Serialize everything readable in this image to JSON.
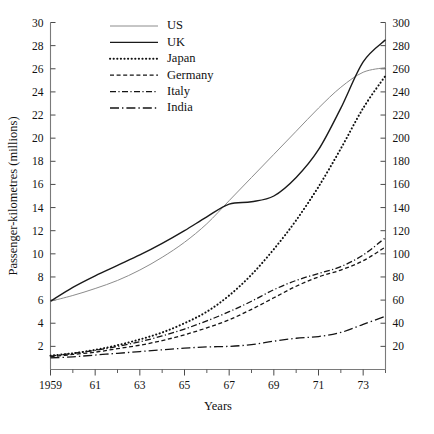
{
  "chart_data": {
    "type": "line",
    "title": "",
    "xlabel": "Years",
    "ylabel": "Passenger-kilometres (millions)",
    "xlim": [
      1959,
      1974
    ],
    "ylim": [
      0,
      30
    ],
    "y2lim": [
      0,
      300
    ],
    "grid": false,
    "legend_position": "top-left-inside",
    "x_tick_labels": [
      "1959",
      "61",
      "63",
      "65",
      "67",
      "69",
      "71",
      "73"
    ],
    "x_tick_values": [
      1959,
      1961,
      1963,
      1965,
      1967,
      1969,
      1971,
      1973
    ],
    "x_minor_values": [
      1960,
      1962,
      1964,
      1966,
      1968,
      1970,
      1972,
      1974
    ],
    "y_tick_labels": [
      "2",
      "4",
      "6",
      "8",
      "10",
      "12",
      "14",
      "16",
      "18",
      "20",
      "22",
      "24",
      "26",
      "28",
      "30"
    ],
    "y_tick_values": [
      2,
      4,
      6,
      8,
      10,
      12,
      14,
      16,
      18,
      20,
      22,
      24,
      26,
      28,
      30
    ],
    "y2_tick_labels": [
      "20",
      "40",
      "60",
      "80",
      "100",
      "120",
      "140",
      "160",
      "180",
      "200",
      "220",
      "240",
      "260",
      "280",
      "300"
    ],
    "y2_tick_values": [
      20,
      40,
      60,
      80,
      100,
      120,
      140,
      160,
      180,
      200,
      220,
      240,
      260,
      280,
      300
    ],
    "x": [
      1959,
      1960,
      1961,
      1962,
      1963,
      1964,
      1965,
      1966,
      1967,
      1968,
      1969,
      1970,
      1971,
      1972,
      1973,
      1974
    ],
    "series": [
      {
        "name": "US",
        "style": "solid-thin-gray",
        "color": "#8c8c8c",
        "width": 1.0,
        "dash": "none",
        "values": [
          5.9,
          6.4,
          7.0,
          7.7,
          8.6,
          9.7,
          11.0,
          12.6,
          14.6,
          16.6,
          18.6,
          20.6,
          22.6,
          24.4,
          25.7,
          26.1
        ]
      },
      {
        "name": "UK",
        "style": "solid-black",
        "color": "#1a1a1a",
        "width": 1.4,
        "dash": "none",
        "values": [
          5.9,
          7.1,
          8.1,
          9.0,
          9.9,
          10.9,
          12.0,
          13.2,
          14.3,
          14.5,
          15.0,
          16.6,
          19.0,
          22.6,
          26.6,
          28.5
        ]
      },
      {
        "name": "Japan",
        "style": "dotted",
        "color": "#111111",
        "width": 2.0,
        "dash": "0.2,3.4",
        "values": [
          1.2,
          1.4,
          1.7,
          2.1,
          2.6,
          3.2,
          4.0,
          5.0,
          6.4,
          8.2,
          10.4,
          12.9,
          15.8,
          19.1,
          22.6,
          25.4
        ]
      },
      {
        "name": "Germany",
        "style": "dashed",
        "color": "#141414",
        "width": 1.3,
        "dash": "4,2.6",
        "values": [
          1.1,
          1.3,
          1.5,
          1.8,
          2.1,
          2.5,
          3.0,
          3.6,
          4.3,
          5.2,
          6.2,
          7.2,
          8.0,
          8.6,
          9.4,
          10.6
        ]
      },
      {
        "name": "Italy",
        "style": "dash-dot",
        "color": "#141414",
        "width": 1.3,
        "dash": "6,2.4,1.2,2.4",
        "values": [
          1.15,
          1.4,
          1.65,
          2.0,
          2.4,
          2.9,
          3.5,
          4.2,
          5.0,
          5.9,
          6.9,
          7.7,
          8.3,
          8.9,
          9.9,
          11.4
        ]
      },
      {
        "name": "India",
        "style": "long-dash-dot",
        "color": "#141414",
        "width": 1.3,
        "dash": "9,3,1.4,3",
        "values": [
          1.0,
          1.1,
          1.25,
          1.4,
          1.55,
          1.7,
          1.85,
          1.95,
          2.0,
          2.15,
          2.45,
          2.7,
          2.85,
          3.2,
          3.9,
          4.6
        ]
      }
    ]
  },
  "legend": {
    "items": [
      {
        "label": "US"
      },
      {
        "label": "UK"
      },
      {
        "label": "Japan"
      },
      {
        "label": "Germany"
      },
      {
        "label": "Italy"
      },
      {
        "label": "India"
      }
    ]
  }
}
